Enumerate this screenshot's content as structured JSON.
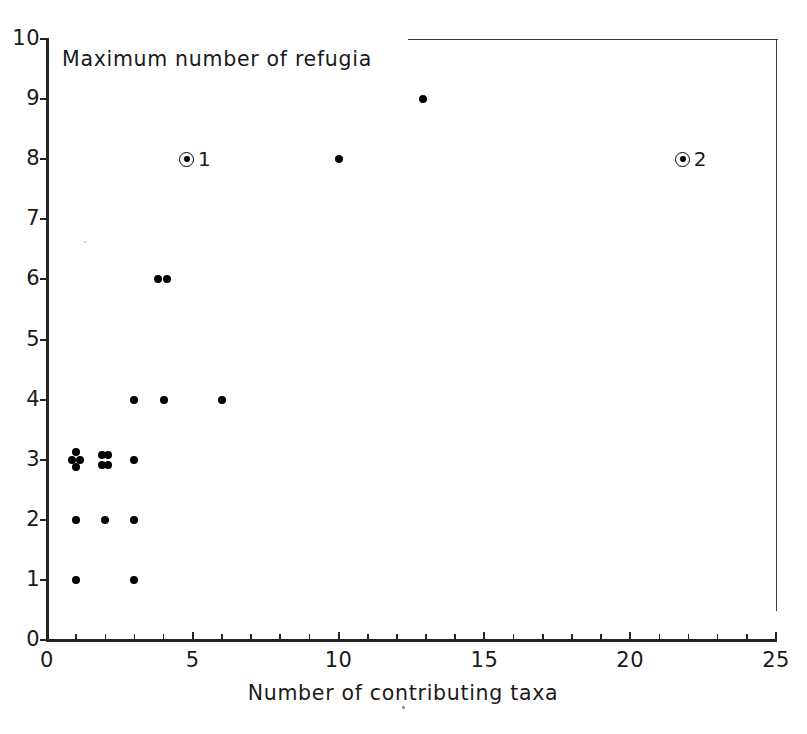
{
  "chart_data": {
    "type": "scatter",
    "title": "Maximum number of refugia",
    "xlabel": "Number of contributing taxa",
    "ylabel": "",
    "xlim": [
      0,
      25
    ],
    "ylim": [
      0,
      10
    ],
    "grid": false,
    "legend": "none",
    "x_ticks": [
      0,
      5,
      10,
      15,
      20,
      25
    ],
    "x_tick_labels": [
      "0",
      "5",
      "10",
      "15",
      "20",
      "25"
    ],
    "x_minor_ticks": [
      1,
      2,
      3,
      4,
      6,
      7,
      8,
      9,
      11,
      12,
      13,
      14,
      16,
      17,
      18,
      19,
      21,
      22,
      23,
      24
    ],
    "y_ticks": [
      0,
      1,
      2,
      3,
      4,
      5,
      6,
      7,
      8,
      9,
      10
    ],
    "y_tick_labels": [
      "0",
      "1",
      "2",
      "3",
      "4",
      "5",
      "6",
      "7",
      "8",
      "9",
      "10"
    ],
    "points": [
      {
        "x": 0.85,
        "y": 3.0
      },
      {
        "x": 1.0,
        "y": 3.12
      },
      {
        "x": 1.12,
        "y": 3.0
      },
      {
        "x": 1.0,
        "y": 2.88
      },
      {
        "x": 1.9,
        "y": 3.08
      },
      {
        "x": 2.08,
        "y": 3.08
      },
      {
        "x": 1.9,
        "y": 2.92
      },
      {
        "x": 2.08,
        "y": 2.92
      },
      {
        "x": 3.0,
        "y": 3.0
      },
      {
        "x": 1.0,
        "y": 2.0
      },
      {
        "x": 2.0,
        "y": 2.0
      },
      {
        "x": 3.0,
        "y": 2.0
      },
      {
        "x": 1.0,
        "y": 1.0
      },
      {
        "x": 3.0,
        "y": 1.0
      },
      {
        "x": 3.0,
        "y": 4.0
      },
      {
        "x": 4.0,
        "y": 4.0
      },
      {
        "x": 6.0,
        "y": 4.0
      },
      {
        "x": 3.82,
        "y": 6.0
      },
      {
        "x": 4.12,
        "y": 6.0
      },
      {
        "x": 10.0,
        "y": 8.0
      },
      {
        "x": 12.9,
        "y": 9.0
      }
    ],
    "annotated_markers": [
      {
        "x": 4.8,
        "y": 8.0,
        "label": "1",
        "style": "circled-dot"
      },
      {
        "x": 21.8,
        "y": 8.0,
        "label": "2",
        "style": "circled-dot"
      }
    ]
  }
}
